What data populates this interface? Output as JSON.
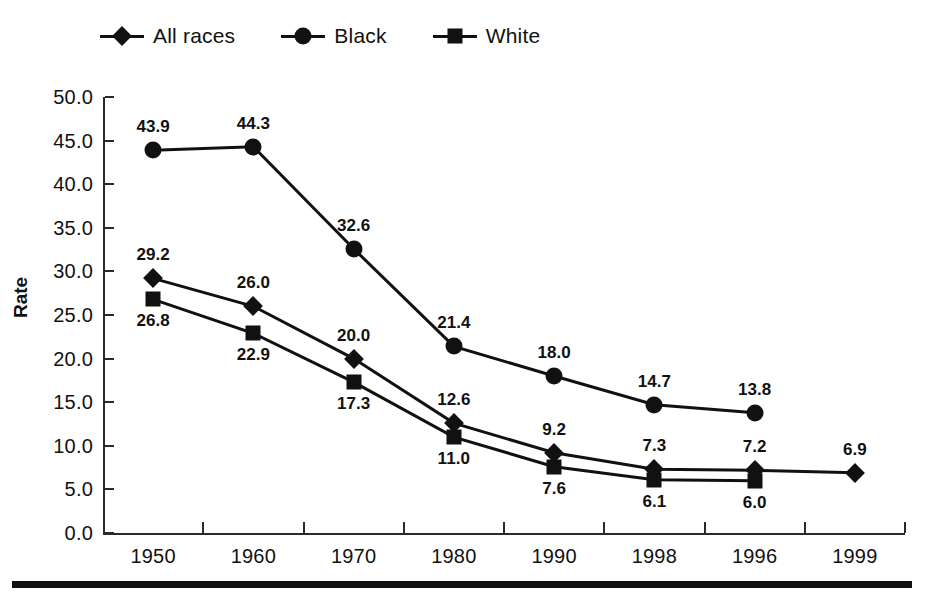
{
  "chart_data": {
    "type": "line",
    "title": "",
    "xlabel": "",
    "ylabel": "Rate",
    "categories": [
      "1950",
      "1960",
      "1970",
      "1980",
      "1990",
      "1998",
      "1996",
      "1999"
    ],
    "ylim": [
      0,
      50
    ],
    "ytick_labels": [
      "50.0",
      "45.0",
      "40.0",
      "35.0",
      "30.0",
      "25.0",
      "20.0",
      "15.0",
      "10.0",
      "5.0",
      "0.0"
    ],
    "ytick_values": [
      50,
      45,
      40,
      35,
      30,
      25,
      20,
      15,
      10,
      5,
      0
    ],
    "grid": false,
    "legend_position": "top-left",
    "series": [
      {
        "name": "All races",
        "marker": "diamond",
        "values": [
          29.2,
          26.0,
          20.0,
          12.6,
          9.2,
          7.3,
          7.2,
          6.9
        ],
        "labels": [
          "29.2",
          "26.0",
          "20.0",
          "12.6",
          "9.2",
          "7.3",
          "7.2",
          "6.9"
        ],
        "label_side": [
          "above",
          "above",
          "above",
          "above",
          "above",
          "above",
          "above",
          "above"
        ]
      },
      {
        "name": "Black",
        "marker": "circle",
        "values": [
          43.9,
          44.3,
          32.6,
          21.4,
          18.0,
          14.7,
          13.8,
          null
        ],
        "labels": [
          "43.9",
          "44.3",
          "32.6",
          "21.4",
          "18.0",
          "14.7",
          "13.8",
          ""
        ],
        "label_side": [
          "above",
          "above",
          "above",
          "above",
          "above",
          "above",
          "above",
          ""
        ]
      },
      {
        "name": "White",
        "marker": "square",
        "values": [
          26.8,
          22.9,
          17.3,
          11.0,
          7.6,
          6.1,
          6.0,
          null
        ],
        "labels": [
          "26.8",
          "22.9",
          "17.3",
          "11.0",
          "7.6",
          "6.1",
          "6.0",
          ""
        ],
        "label_side": [
          "below",
          "below",
          "below",
          "below",
          "below",
          "below",
          "below",
          ""
        ]
      }
    ]
  },
  "legend": {
    "items": [
      {
        "label": "All races",
        "marker": "diamond"
      },
      {
        "label": "Black",
        "marker": "circle"
      },
      {
        "label": "White",
        "marker": "square"
      }
    ]
  },
  "axis": {
    "y_title": "Rate"
  },
  "colors": {
    "ink": "#111111",
    "axis": "#2a2a2a",
    "background": "#ffffff"
  }
}
